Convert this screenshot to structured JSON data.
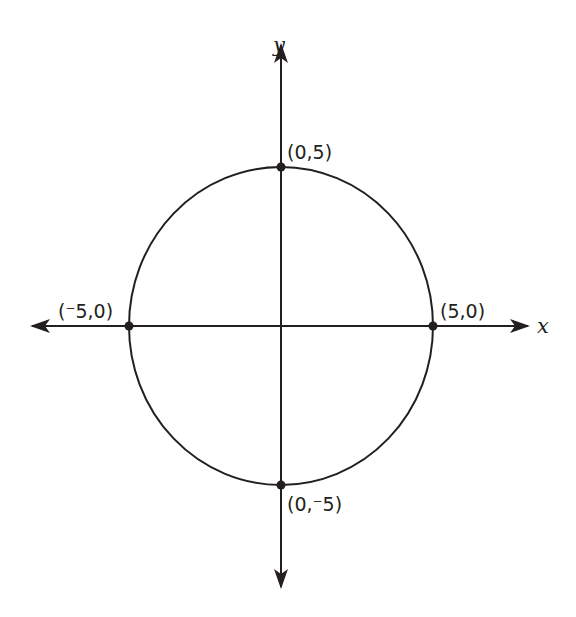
{
  "diagram": {
    "type": "coordinate-plane-circle",
    "axes": {
      "x_label": "x",
      "y_label": "y"
    },
    "points": [
      {
        "id": "top",
        "label": "(0,5)",
        "x": 0,
        "y": 5
      },
      {
        "id": "left",
        "label": "(⁻5,0)",
        "x": -5,
        "y": 0
      },
      {
        "id": "right",
        "label": "(5,0)",
        "x": 5,
        "y": 0
      },
      {
        "id": "bottom",
        "label": "(0,⁻5)",
        "x": 0,
        "y": -5
      }
    ],
    "circle": {
      "center": [
        0,
        0
      ],
      "radius": 5
    },
    "colors": {
      "stroke": "#231f20",
      "background": "#ffffff"
    }
  }
}
